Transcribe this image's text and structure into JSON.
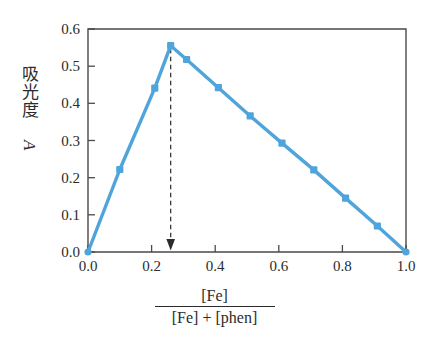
{
  "chart_data": {
    "type": "line",
    "title": "",
    "subtitle": "",
    "xlabel_numerator": "[Fe]",
    "xlabel_denominator": "[Fe] + [phen]",
    "ylabel_text": "吸光度",
    "ylabel_symbol": "A",
    "xlim": [
      0.0,
      1.0
    ],
    "ylim": [
      0.0,
      0.6
    ],
    "xticks": [
      "0.0",
      "0.2",
      "0.4",
      "0.6",
      "0.8",
      "1.0"
    ],
    "xtick_values": [
      0.0,
      0.2,
      0.4,
      0.6,
      0.8,
      1.0
    ],
    "yticks": [
      "0.0",
      "0.1",
      "0.2",
      "0.3",
      "0.4",
      "0.5",
      "0.6"
    ],
    "ytick_values": [
      0.0,
      0.1,
      0.2,
      0.3,
      0.4,
      0.5,
      0.6
    ],
    "grid": false,
    "legend": "none",
    "series": [
      {
        "name": "absorbance",
        "color": "#4FA5DB",
        "marker": "square",
        "x": [
          0.0,
          0.1,
          0.21,
          0.26,
          0.31,
          0.41,
          0.51,
          0.61,
          0.71,
          0.81,
          0.91,
          1.0
        ],
        "y": [
          0.0,
          0.222,
          0.441,
          0.555,
          0.518,
          0.442,
          0.366,
          0.293,
          0.221,
          0.145,
          0.07,
          0.0
        ]
      }
    ],
    "annotations": [
      {
        "type": "arrow",
        "style": "dashed-vertical",
        "color": "#3a3a3a",
        "x": 0.26,
        "y_start": 0.555,
        "y_end": 0.0,
        "label": ""
      }
    ]
  },
  "axes": {
    "frame_color": "#4a4a4a",
    "tick_color": "#4a4a4a",
    "background": "#ffffff"
  }
}
